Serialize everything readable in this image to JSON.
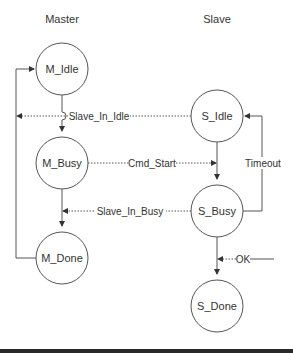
{
  "diagram": {
    "columns": {
      "master": "Master",
      "slave": "Slave"
    },
    "states": {
      "m_idle": "M_Idle",
      "m_busy": "M_Busy",
      "m_done": "M_Done",
      "s_idle": "S_Idle",
      "s_busy": "S_Busy",
      "s_done": "S_Done"
    },
    "signals": {
      "slave_in_idle": "Slave_In_Idle",
      "cmd_start": "Cmd_Start",
      "slave_in_busy": "Slave_In_Busy",
      "timeout": "Timeout",
      "ok": "OK"
    },
    "colors": {
      "stroke": "#555555",
      "text": "#333333",
      "background": "#ffffff"
    }
  }
}
